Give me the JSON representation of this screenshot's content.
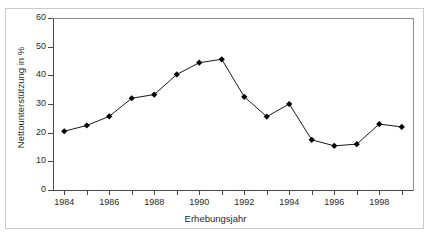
{
  "figure": {
    "top_caption": "",
    "border_color": "#c9c9cf",
    "axis_color": "#4a4a4a",
    "series_color": "#000000"
  },
  "chart_data": {
    "type": "line",
    "title": "",
    "xlabel": "Erhebungsjahr",
    "ylabel": "Nettounterstützung in %",
    "x": [
      1984,
      1985,
      1986,
      1987,
      1988,
      1989,
      1990,
      1991,
      1992,
      1993,
      1994,
      1995,
      1996,
      1997,
      1998,
      1999
    ],
    "values": [
      20.5,
      22.5,
      25.7,
      32.0,
      33.3,
      40.3,
      44.4,
      45.6,
      32.5,
      25.6,
      30.0,
      17.5,
      15.4,
      16.0,
      23.0,
      22.0
    ],
    "xlim": [
      1983.5,
      1999.5
    ],
    "ylim": [
      0,
      60
    ],
    "ytick_labels": [
      "0",
      "10",
      "20",
      "30",
      "40",
      "50",
      "60"
    ],
    "ytick_values": [
      0,
      10,
      20,
      30,
      40,
      50,
      60
    ],
    "xtick_labels": [
      "1984",
      "1986",
      "1988",
      "1990",
      "1992",
      "1994",
      "1996",
      "1998"
    ],
    "xtick_values": [
      1984,
      1986,
      1988,
      1990,
      1992,
      1994,
      1996,
      1998
    ],
    "xtick_minor_values": [
      1985,
      1987,
      1989,
      1991,
      1993,
      1995,
      1997,
      1999
    ],
    "grid": false,
    "legend": null,
    "marker": "diamond",
    "marker_size": 4
  }
}
